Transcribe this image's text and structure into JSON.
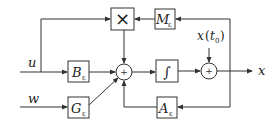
{
  "diagram": {
    "inputs": {
      "u": "u",
      "w": "w"
    },
    "output": "x",
    "initial_condition": {
      "var": "x",
      "open": "(",
      "arg": "t",
      "arg_sub": "0",
      "close": ")"
    },
    "blocks": {
      "multiply": "×",
      "M": {
        "name": "M",
        "sub": "ε"
      },
      "B": {
        "name": "B",
        "sub": "ε"
      },
      "G": {
        "name": "G",
        "sub": "ε"
      },
      "A": {
        "name": "A",
        "sub": "ε"
      },
      "integrator": "∫"
    },
    "sum_symbol": "+"
  }
}
